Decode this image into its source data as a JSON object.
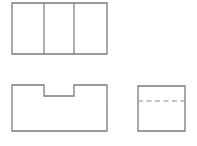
{
  "sheet": {
    "title": "Orthographic Three-View Drawing",
    "background_color": "#ffffff",
    "width": 197,
    "height": 146,
    "object_line_color": "#7a7a7a",
    "hidden_line_color": "#8c8c8c"
  },
  "views": {
    "top": {
      "name": "Top View",
      "shape": "rectangle-with-two-vertical-division-lines",
      "x": 12,
      "y": 3,
      "width": 95,
      "height": 51,
      "outline_points": "12,3 107,3 107,54 12,54",
      "divider_1_x": 44,
      "divider_2_x": 74,
      "divider_1_points": "44,3 44,54",
      "divider_2_points": "74,3 74,54"
    },
    "front": {
      "name": "Front View",
      "shape": "rectangle-with-top-center-rectangular-notch",
      "x": 12,
      "y": 85,
      "width": 95,
      "height": 46,
      "notch_left_x": 44,
      "notch_right_x": 74,
      "notch_bottom_y": 96,
      "notch_width": 30,
      "notch_depth": 11,
      "outline_points": "12,85 44,85 44,96 74,96 74,85 107,85 107,131 12,131"
    },
    "side": {
      "name": "Right Side View",
      "shape": "rectangle-with-horizontal-hidden-line",
      "x": 138,
      "y": 86,
      "width": 47,
      "height": 45,
      "outline_points": "138,86 185,86 185,131 138,131",
      "hidden_line_y": 101,
      "hidden_line_points": "138,101 185,101"
    }
  }
}
